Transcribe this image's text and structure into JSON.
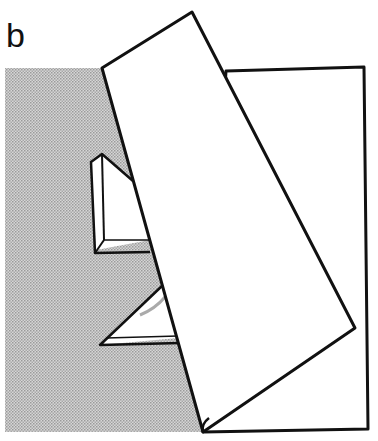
{
  "figure": {
    "panel_label": "b",
    "colors": {
      "stroke": "#111111",
      "paper": "#ffffff",
      "shade": "#c9c9c9",
      "shade_dot": "#9a9a9a"
    }
  }
}
